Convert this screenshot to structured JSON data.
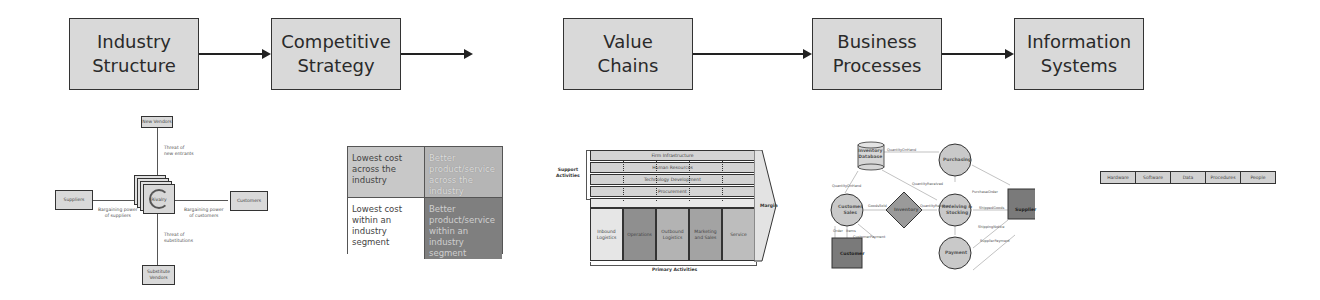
{
  "flow": {
    "steps": [
      {
        "line1": "Industry",
        "line2": "Structure"
      },
      {
        "line1": "Competitive",
        "line2": "Strategy"
      },
      {
        "line1": "Value",
        "line2": "Chains"
      },
      {
        "line1": "Business",
        "line2": "Processes"
      },
      {
        "line1": "Information",
        "line2": "Systems"
      }
    ]
  },
  "five_forces": {
    "new_vendors": "New Vendors",
    "suppliers": "Suppliers",
    "customers": "Customers",
    "substitute_line1": "Substitute",
    "substitute_line2": "Vendors",
    "rivals": "Rivalry",
    "threat_new_1": "Threat of",
    "threat_new_2": "new entrants",
    "bp_suppliers_1": "Bargaining power",
    "bp_suppliers_2": "of suppliers",
    "bp_customers_1": "Bargaining power",
    "bp_customers_2": "of customers",
    "threat_sub_1": "Threat of",
    "threat_sub_2": "substitutions"
  },
  "strategy_grid": {
    "cells": [
      "Lowest cost across the industry",
      "Better product/service across the industry",
      "Lowest cost within an industry segment",
      "Better product/service within an industry segment"
    ]
  },
  "value_chain": {
    "support_label_1": "Support",
    "support_label_2": "Activities",
    "support": [
      "Firm Infrastructure",
      "Human Resources",
      "Technology Development",
      "Procurement"
    ],
    "primary": [
      {
        "line1": "Inbound",
        "line2": "Logistics"
      },
      {
        "line1": "Operations",
        "line2": ""
      },
      {
        "line1": "Outbound",
        "line2": "Logistics"
      },
      {
        "line1": "Marketing",
        "line2": "and Sales"
      },
      {
        "line1": "Service",
        "line2": ""
      }
    ],
    "margin": "Margin",
    "primary_label": "Primary Activities"
  },
  "business_process": {
    "inventory_db_1": "Inventory",
    "inventory_db_2": "Database",
    "purchasing": "Purchasing",
    "customer_sales_1": "Customer",
    "customer_sales_2": "Sales",
    "inventory": "Inventory",
    "receiving_1": "Receiving &",
    "receiving_2": "Stocking",
    "supplier": "Supplier",
    "customer": "Customer",
    "payment": "Payment",
    "flows": {
      "quantity_on_hand": "QuantityOnHand",
      "quantity_on_hand2": "QuantityOnHand",
      "quantity_received": "QuantityReceived",
      "quantity_received2": "QuantityReceived",
      "goods_sold": "GoodsSold",
      "purchase_order": "PurchaseOrder",
      "shipped_goods": "ShippedGoods",
      "shipping_notice": "ShippingNotice",
      "supplier_payment": "SupplierPayment",
      "order": "Order",
      "items": "Items",
      "customer_payment": "CustomerPayment"
    }
  },
  "information_systems": {
    "components": [
      "Hardware",
      "Software",
      "Data",
      "Procedures",
      "People"
    ]
  }
}
